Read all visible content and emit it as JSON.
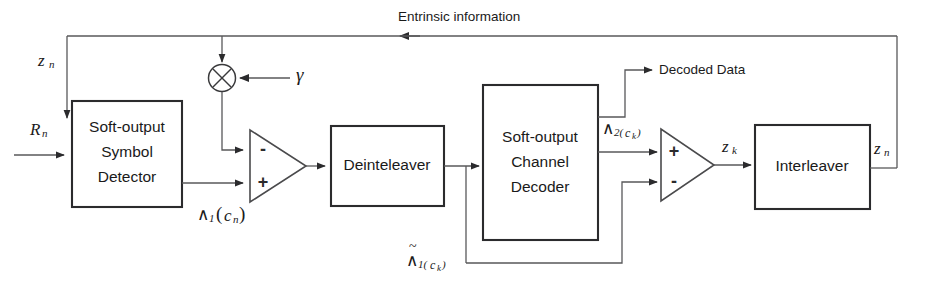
{
  "diagram": {
    "background_color": "#ffffff",
    "line_color": "#58585a",
    "block_border_color": "#2b2b2d",
    "text_color": "#1a1a1a",
    "blocks": [
      {
        "id": "symbol-detector",
        "lines": [
          "Soft-output",
          "Symbol",
          "Detector"
        ]
      },
      {
        "id": "deinterleaver",
        "lines": [
          "Deinteleaver"
        ]
      },
      {
        "id": "channel-decoder",
        "lines": [
          "Soft-output",
          "Channel",
          "Decoder"
        ]
      },
      {
        "id": "interleaver",
        "lines": [
          "Interleaver"
        ]
      }
    ],
    "labels": {
      "entrinsic": "Entrinsic information",
      "decoded_data": "Decoded Data",
      "gamma": "γ",
      "input_rn_base": "R",
      "input_rn_sub": "n",
      "zn_left_base": "z",
      "zn_left_sub": "n",
      "zk_base": "z",
      "zk_sub": "k",
      "zn_right_base": "z",
      "zn_right_sub": "n",
      "lambda1_cn": {
        "wedge": "∧",
        "sub": "1",
        "open": "(",
        "var": "c",
        "varsub": "n",
        "close": ")"
      },
      "lambda2_ck": {
        "wedge": "∧",
        "sub": "2(",
        "var": "c",
        "varsub": "k",
        "close": ")"
      },
      "lambda1_tilde_ck": {
        "tilde": "~",
        "wedge": "∧",
        "sub": "1(",
        "var": "c",
        "varsub": "k",
        "close": ")"
      }
    },
    "adders": [
      {
        "id": "left-subtractor",
        "top_sign": "-",
        "bottom_sign": "+"
      },
      {
        "id": "right-subtractor",
        "top_sign": "+",
        "bottom_sign": "-"
      }
    ],
    "multiplier": {
      "id": "gamma-multiplier",
      "glyph": "multiply-circle"
    }
  }
}
